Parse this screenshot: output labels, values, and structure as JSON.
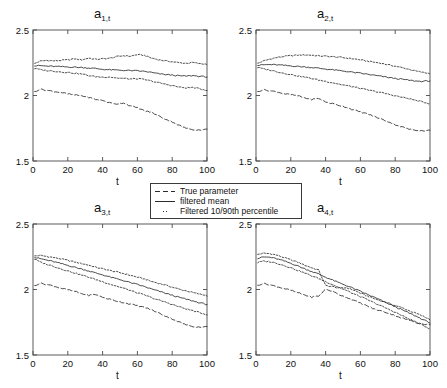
{
  "figure": {
    "width": 447,
    "height": 388,
    "background": "#ffffff",
    "line_color": "#2b2b2b",
    "frame_color": "#4a4a4a"
  },
  "legend": {
    "position": "center",
    "border_color": "#3a3a3a",
    "items": [
      {
        "label": "True parameter",
        "style": "dashed",
        "key": "dashed-line-key"
      },
      {
        "label": "filtered mean",
        "style": "solid",
        "key": "solid-line-key"
      },
      {
        "label": "Filtered 10/90th percentile",
        "style": "dotted",
        "key": "dotted-line-key"
      }
    ]
  },
  "chart_data": [
    {
      "type": "line",
      "title": "a",
      "title_sub": "1,t",
      "xlabel": "t",
      "ylabel": "",
      "xlim": [
        0,
        100
      ],
      "ylim": [
        1.5,
        2.5
      ],
      "xticks": [
        0,
        20,
        40,
        60,
        80,
        100
      ],
      "yticks": [
        1.5,
        2,
        2.5
      ],
      "ytick_labels": [
        "1.5",
        "2",
        "2.5"
      ],
      "grid": false,
      "series": [
        {
          "name": "Filtered 90th percentile",
          "style": "dotted",
          "x": [
            1,
            4,
            8,
            12,
            16,
            20,
            24,
            28,
            32,
            36,
            40,
            44,
            48,
            52,
            56,
            60,
            64,
            68,
            72,
            76,
            80,
            84,
            88,
            92,
            96,
            100
          ],
          "values": [
            2.245,
            2.262,
            2.268,
            2.264,
            2.268,
            2.272,
            2.28,
            2.272,
            2.286,
            2.276,
            2.28,
            2.284,
            2.296,
            2.304,
            2.3,
            2.312,
            2.306,
            2.286,
            2.274,
            2.264,
            2.258,
            2.25,
            2.246,
            2.252,
            2.242,
            2.24
          ]
        },
        {
          "name": "filtered mean",
          "style": "solid",
          "x": [
            1,
            4,
            8,
            12,
            16,
            20,
            24,
            28,
            32,
            36,
            40,
            44,
            48,
            52,
            56,
            60,
            64,
            68,
            72,
            76,
            80,
            84,
            88,
            92,
            96,
            100
          ],
          "values": [
            2.226,
            2.228,
            2.224,
            2.222,
            2.22,
            2.218,
            2.216,
            2.214,
            2.21,
            2.206,
            2.2,
            2.196,
            2.194,
            2.192,
            2.19,
            2.188,
            2.184,
            2.176,
            2.166,
            2.16,
            2.156,
            2.15,
            2.148,
            2.152,
            2.146,
            2.142
          ]
        },
        {
          "name": "Filtered 10th percentile",
          "style": "dotted",
          "x": [
            1,
            4,
            8,
            12,
            16,
            20,
            24,
            28,
            32,
            36,
            40,
            44,
            48,
            52,
            56,
            60,
            64,
            68,
            72,
            76,
            80,
            84,
            88,
            92,
            96,
            100
          ],
          "values": [
            2.206,
            2.198,
            2.19,
            2.186,
            2.18,
            2.176,
            2.17,
            2.164,
            2.152,
            2.144,
            2.14,
            2.142,
            2.134,
            2.13,
            2.126,
            2.128,
            2.122,
            2.11,
            2.098,
            2.086,
            2.076,
            2.064,
            2.058,
            2.062,
            2.05,
            2.04
          ]
        },
        {
          "name": "True parameter",
          "style": "dashed",
          "x": [
            1,
            4,
            8,
            12,
            16,
            20,
            24,
            28,
            32,
            36,
            40,
            44,
            48,
            52,
            56,
            60,
            64,
            68,
            72,
            76,
            80,
            84,
            88,
            92,
            96,
            100
          ],
          "values": [
            2.03,
            2.048,
            2.04,
            2.03,
            2.024,
            2.012,
            2.004,
            1.998,
            1.986,
            1.97,
            1.962,
            1.944,
            1.936,
            1.944,
            1.92,
            1.906,
            1.884,
            1.872,
            1.846,
            1.82,
            1.8,
            1.772,
            1.75,
            1.74,
            1.736,
            1.742
          ]
        }
      ]
    },
    {
      "type": "line",
      "title": "a",
      "title_sub": "2,t",
      "xlabel": "t",
      "ylabel": "",
      "xlim": [
        0,
        100
      ],
      "ylim": [
        1.5,
        2.5
      ],
      "xticks": [
        0,
        20,
        40,
        60,
        80,
        100
      ],
      "yticks": [
        1.5,
        2,
        2.5
      ],
      "ytick_labels": [
        "1.5",
        "2",
        "2.5"
      ],
      "grid": false,
      "series": [
        {
          "name": "Filtered 90th percentile",
          "style": "dotted",
          "x": [
            1,
            4,
            8,
            12,
            16,
            20,
            24,
            28,
            32,
            36,
            40,
            44,
            48,
            52,
            56,
            60,
            64,
            68,
            72,
            76,
            80,
            84,
            88,
            92,
            96,
            100
          ],
          "values": [
            2.246,
            2.262,
            2.278,
            2.29,
            2.298,
            2.304,
            2.308,
            2.31,
            2.308,
            2.302,
            2.3,
            2.296,
            2.292,
            2.286,
            2.28,
            2.272,
            2.262,
            2.254,
            2.246,
            2.234,
            2.224,
            2.212,
            2.2,
            2.186,
            2.176,
            2.168
          ]
        },
        {
          "name": "filtered mean",
          "style": "solid",
          "x": [
            1,
            4,
            8,
            12,
            16,
            20,
            24,
            28,
            32,
            36,
            40,
            44,
            48,
            52,
            56,
            60,
            64,
            68,
            72,
            76,
            80,
            84,
            88,
            92,
            96,
            100
          ],
          "values": [
            2.23,
            2.234,
            2.236,
            2.234,
            2.23,
            2.226,
            2.222,
            2.218,
            2.214,
            2.208,
            2.202,
            2.196,
            2.19,
            2.184,
            2.176,
            2.17,
            2.162,
            2.154,
            2.146,
            2.138,
            2.13,
            2.124,
            2.116,
            2.11,
            2.108,
            2.112
          ]
        },
        {
          "name": "Filtered 10th percentile",
          "style": "dotted",
          "x": [
            1,
            4,
            8,
            12,
            16,
            20,
            24,
            28,
            32,
            36,
            40,
            44,
            48,
            52,
            56,
            60,
            64,
            68,
            72,
            76,
            80,
            84,
            88,
            92,
            96,
            100
          ],
          "values": [
            2.214,
            2.204,
            2.194,
            2.182,
            2.17,
            2.16,
            2.15,
            2.14,
            2.13,
            2.118,
            2.108,
            2.098,
            2.086,
            2.076,
            2.066,
            2.054,
            2.042,
            2.032,
            2.022,
            2.01,
            1.998,
            1.986,
            1.976,
            1.962,
            1.95,
            1.938
          ]
        },
        {
          "name": "True parameter",
          "style": "dashed",
          "x": [
            1,
            4,
            8,
            12,
            16,
            20,
            24,
            28,
            32,
            36,
            40,
            44,
            48,
            52,
            56,
            60,
            64,
            68,
            72,
            76,
            80,
            84,
            88,
            92,
            96,
            100
          ],
          "values": [
            2.03,
            2.044,
            2.036,
            2.028,
            2.014,
            2.006,
            1.998,
            1.982,
            1.97,
            1.978,
            1.95,
            1.938,
            1.924,
            1.91,
            1.89,
            1.874,
            1.86,
            1.84,
            1.82,
            1.8,
            1.778,
            1.76,
            1.742,
            1.736,
            1.73,
            1.734
          ]
        }
      ]
    },
    {
      "type": "line",
      "title": "a",
      "title_sub": "3,t",
      "xlabel": "t",
      "ylabel": "",
      "xlim": [
        0,
        100
      ],
      "ylim": [
        1.5,
        2.5
      ],
      "xticks": [
        0,
        20,
        40,
        60,
        80,
        100
      ],
      "yticks": [
        1.5,
        2,
        2.5
      ],
      "ytick_labels": [
        "1.5",
        "2",
        "2.5"
      ],
      "grid": false,
      "series": [
        {
          "name": "Filtered 90th percentile",
          "style": "dotted",
          "x": [
            1,
            4,
            8,
            12,
            16,
            20,
            24,
            28,
            32,
            36,
            40,
            44,
            48,
            52,
            56,
            60,
            64,
            68,
            72,
            76,
            80,
            84,
            88,
            92,
            96,
            100
          ],
          "values": [
            2.256,
            2.26,
            2.252,
            2.244,
            2.234,
            2.222,
            2.21,
            2.198,
            2.186,
            2.17,
            2.158,
            2.146,
            2.134,
            2.122,
            2.108,
            2.094,
            2.08,
            2.062,
            2.048,
            2.034,
            2.018,
            2.002,
            1.99,
            1.976,
            1.964,
            1.954
          ]
        },
        {
          "name": "filtered mean",
          "style": "solid",
          "x": [
            1,
            4,
            8,
            12,
            16,
            20,
            24,
            28,
            32,
            36,
            40,
            44,
            48,
            52,
            56,
            60,
            64,
            68,
            72,
            76,
            80,
            84,
            88,
            92,
            96,
            100
          ],
          "values": [
            2.244,
            2.236,
            2.224,
            2.212,
            2.198,
            2.184,
            2.17,
            2.156,
            2.142,
            2.126,
            2.112,
            2.096,
            2.082,
            2.068,
            2.052,
            2.038,
            2.022,
            2.004,
            1.988,
            1.972,
            1.956,
            1.94,
            1.926,
            1.912,
            1.898,
            1.886
          ]
        },
        {
          "name": "Filtered 10th percentile",
          "style": "dotted",
          "x": [
            1,
            4,
            8,
            12,
            16,
            20,
            24,
            28,
            32,
            36,
            40,
            44,
            48,
            52,
            56,
            60,
            64,
            68,
            72,
            76,
            80,
            84,
            88,
            92,
            96,
            100
          ],
          "values": [
            2.232,
            2.21,
            2.192,
            2.176,
            2.158,
            2.142,
            2.126,
            2.11,
            2.094,
            2.076,
            2.06,
            2.042,
            2.026,
            2.01,
            1.992,
            1.974,
            1.958,
            1.938,
            1.92,
            1.904,
            1.886,
            1.868,
            1.852,
            1.838,
            1.822,
            1.808
          ]
        },
        {
          "name": "True parameter",
          "style": "dashed",
          "x": [
            1,
            4,
            8,
            12,
            16,
            20,
            24,
            28,
            32,
            36,
            40,
            44,
            48,
            52,
            56,
            60,
            64,
            68,
            72,
            76,
            80,
            84,
            88,
            92,
            96,
            100
          ],
          "values": [
            2.03,
            2.048,
            2.038,
            2.026,
            2.01,
            1.998,
            1.986,
            1.968,
            1.956,
            1.962,
            1.94,
            1.926,
            1.912,
            1.9,
            1.888,
            1.876,
            1.864,
            1.846,
            1.822,
            1.798,
            1.776,
            1.752,
            1.73,
            1.718,
            1.712,
            1.716
          ]
        }
      ]
    },
    {
      "type": "line",
      "title": "a",
      "title_sub": "4,t",
      "xlabel": "t",
      "ylabel": "",
      "xlim": [
        0,
        100
      ],
      "ylim": [
        1.5,
        2.5
      ],
      "xticks": [
        0,
        20,
        40,
        60,
        80,
        100
      ],
      "yticks": [
        1.5,
        2,
        2.5
      ],
      "ytick_labels": [
        "1.5",
        "2",
        "2.5"
      ],
      "grid": false,
      "series": [
        {
          "name": "Filtered 90th percentile",
          "style": "dotted",
          "x": [
            1,
            4,
            8,
            12,
            16,
            20,
            24,
            28,
            32,
            36,
            40,
            44,
            48,
            52,
            56,
            60,
            64,
            68,
            72,
            76,
            80,
            84,
            88,
            92,
            96,
            100
          ],
          "values": [
            2.268,
            2.276,
            2.274,
            2.262,
            2.244,
            2.226,
            2.208,
            2.186,
            2.166,
            2.148,
            2.03,
            2.022,
            2.01,
            2.014,
            1.996,
            1.972,
            1.95,
            1.93,
            1.912,
            1.896,
            1.878,
            1.86,
            1.838,
            1.818,
            1.796,
            1.772
          ]
        },
        {
          "name": "filtered mean",
          "style": "solid",
          "x": [
            1,
            4,
            8,
            12,
            16,
            20,
            24,
            28,
            32,
            36,
            40,
            44,
            48,
            52,
            56,
            60,
            64,
            68,
            72,
            76,
            80,
            84,
            88,
            92,
            96,
            100
          ],
          "values": [
            2.236,
            2.248,
            2.246,
            2.234,
            2.218,
            2.2,
            2.18,
            2.158,
            2.138,
            2.118,
            2.094,
            2.072,
            2.05,
            2.03,
            2.008,
            1.986,
            1.962,
            1.94,
            1.916,
            1.892,
            1.868,
            1.844,
            1.82,
            1.796,
            1.77,
            1.746
          ]
        },
        {
          "name": "Filtered 10th percentile",
          "style": "dotted",
          "x": [
            1,
            4,
            8,
            12,
            16,
            20,
            24,
            28,
            32,
            36,
            40,
            44,
            48,
            52,
            56,
            60,
            64,
            68,
            72,
            76,
            80,
            84,
            88,
            92,
            96,
            100
          ],
          "values": [
            2.206,
            2.216,
            2.212,
            2.2,
            2.184,
            2.166,
            2.146,
            2.126,
            2.104,
            2.084,
            2.06,
            2.038,
            2.014,
            1.992,
            1.968,
            1.946,
            1.922,
            1.898,
            1.874,
            1.85,
            1.826,
            1.8,
            1.776,
            1.752,
            1.726,
            1.7
          ]
        },
        {
          "name": "True parameter",
          "style": "dashed",
          "x": [
            1,
            4,
            8,
            12,
            16,
            20,
            24,
            28,
            32,
            36,
            40,
            44,
            48,
            52,
            56,
            60,
            64,
            68,
            72,
            76,
            80,
            84,
            88,
            92,
            96,
            100
          ],
          "values": [
            2.032,
            2.046,
            2.036,
            2.022,
            2.008,
            1.994,
            1.976,
            1.958,
            1.942,
            1.95,
            2.002,
            1.986,
            1.96,
            1.94,
            1.918,
            1.896,
            1.874,
            1.85,
            1.836,
            1.82,
            1.8,
            1.782,
            1.766,
            1.748,
            1.736,
            1.73
          ]
        }
      ]
    }
  ]
}
